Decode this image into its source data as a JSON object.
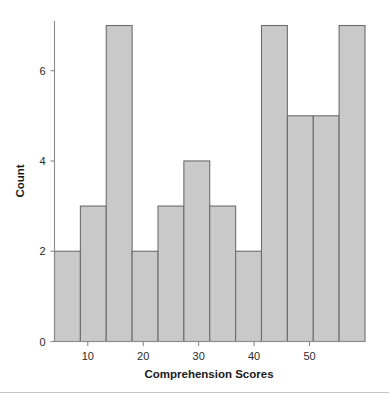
{
  "chart_data": {
    "type": "bar",
    "title": "",
    "subtitle": "",
    "xlabel": "Comprehension Scores",
    "ylabel": "Count",
    "grid": false,
    "legend": null,
    "legend_position": "none",
    "xlim": [
      4,
      60
    ],
    "ylim": [
      0,
      7.1
    ],
    "xticks": [
      10,
      20,
      30,
      40,
      50
    ],
    "xtick_labels": [
      "10",
      "20",
      "30",
      "40",
      "50"
    ],
    "yticks": [
      0,
      2,
      4,
      6
    ],
    "ytick_labels": [
      "0",
      "2",
      "4",
      "6"
    ],
    "bin_width": 4.67,
    "bin_edges": [
      4.0,
      8.67,
      13.33,
      18.0,
      22.67,
      27.33,
      32.0,
      36.67,
      41.33,
      46.0,
      50.67,
      55.33,
      60.0
    ],
    "bin_centers": [
      6.33,
      11.0,
      15.67,
      20.33,
      25.0,
      29.67,
      34.33,
      39.0,
      43.67,
      48.33,
      53.0,
      57.67
    ],
    "categories": [
      "4-8.7",
      "8.7-13.3",
      "13.3-18",
      "18-22.7",
      "22.7-27.3",
      "27.3-32",
      "32-36.7",
      "36.7-41.3",
      "41.3-46",
      "46-50.7",
      "50.7-55.3",
      "55.3-60"
    ],
    "values": [
      2,
      3,
      7,
      2,
      3,
      4,
      3,
      2,
      7,
      5,
      5,
      7
    ],
    "bar_fill_color": "#c9c9c9",
    "bar_edge_color": "#6d6d6d",
    "axis_color": "#8a8a8a",
    "text_color": "#2b2b2b"
  },
  "figure": {
    "bar_fill": "#c9c9c9",
    "bar_edge": "#6d6d6d",
    "axis_color": "#8a8a8a",
    "footer_rule_color": "#c4c4c4"
  }
}
